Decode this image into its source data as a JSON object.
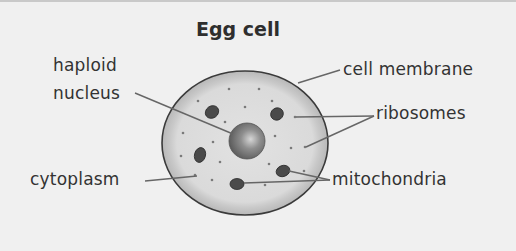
{
  "title": "Egg cell",
  "labels": {
    "haploid": "haploid",
    "nucleus": "nucleus",
    "cell_membrane": "cell membrane",
    "ribosomes": "ribosomes",
    "cytoplasm": "cytoplasm",
    "mitochondria": "mitochondria"
  },
  "colors": {
    "background": "#f0f0f0",
    "cell_outer": "#c4c4c4",
    "cell_inner": "#dcdcdc",
    "membrane_stroke": "#3a3a3a",
    "nucleus": "#8a8a8a",
    "mitochondria": "#4a4a4a",
    "leader_line": "#666666",
    "text": "#333333"
  }
}
